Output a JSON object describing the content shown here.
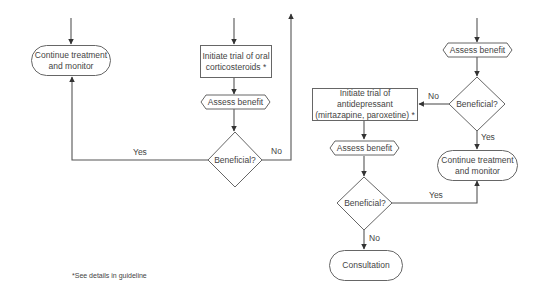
{
  "diagram": {
    "left_branch": {
      "continue_node": {
        "line1": "Continue treatment",
        "line2": "and monitor"
      },
      "initiate_node": {
        "line1": "Initiate trial of oral",
        "line2": "corticosteroids *"
      },
      "assess_node": "Assess benefit",
      "decision_node": "Beneficial?",
      "yes_label": "Yes",
      "no_label": "No"
    },
    "right_branch": {
      "assess_top_node": "Assess benefit",
      "decision_top_node": "Beneficial?",
      "no_label_top": "No",
      "yes_label_top": "Yes",
      "initiate_node": {
        "line1": "Initiate trial of antidepressant",
        "line2": "(mirtazapine, paroxetine) *"
      },
      "assess_bottom_node": "Assess benefit",
      "decision_bottom_node": "Beneficial?",
      "yes_label_bottom": "Yes",
      "no_label_bottom": "No",
      "continue_node": {
        "line1": "Continue treatment",
        "line2": "and monitor"
      },
      "consultation_node": "Consultation"
    },
    "footnote": "*See details in guideline",
    "colors": {
      "stroke": "#555555",
      "text": "#444444",
      "background": "#ffffff"
    }
  }
}
